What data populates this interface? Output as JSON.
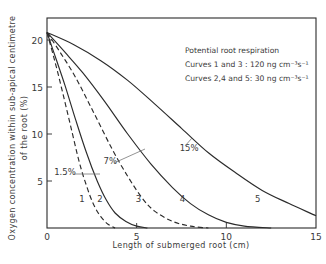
{
  "chart_data": {
    "type": "line",
    "title": "",
    "xlabel": "Length of submerged root (cm)",
    "ylabel_line1": "Oxygen concentration within sub-apical centimetre",
    "ylabel_line2": "of the root (%)",
    "xlim": [
      0,
      15
    ],
    "ylim": [
      0,
      22
    ],
    "x_ticks": [
      0,
      5,
      10,
      15
    ],
    "y_ticks": [
      5,
      10,
      15,
      20
    ],
    "grid": false,
    "legend": {
      "position": "upper right",
      "lines": [
        "Potential root respiration",
        "Curves 1 and 3 : 120 ng cm⁻³s⁻¹",
        "Curves 2,4 and 5: 30 ng cm⁻³s⁻¹"
      ]
    },
    "series": [
      {
        "name": "1",
        "style": "dashed",
        "respiration": "120 ng cm-3 s-1",
        "label_pos": [
          1.95,
          2.8
        ],
        "x": [
          0,
          0.4,
          0.8,
          1.3,
          1.8,
          2.2,
          2.6,
          3.0,
          3.4,
          3.8
        ],
        "y": [
          20.8,
          18.0,
          15.0,
          11.0,
          7.0,
          4.5,
          2.5,
          1.2,
          0.4,
          0.0
        ]
      },
      {
        "name": "2",
        "style": "solid",
        "respiration": "30 ng cm-3 s-1",
        "label_pos": [
          2.95,
          2.8
        ],
        "x": [
          0,
          0.5,
          1.0,
          1.6,
          2.2,
          2.8,
          3.3,
          3.8,
          4.4,
          5.0,
          5.6
        ],
        "y": [
          20.8,
          18.0,
          15.2,
          11.5,
          8.0,
          5.0,
          3.0,
          1.6,
          0.7,
          0.2,
          0.0
        ]
      },
      {
        "name": "3",
        "style": "dashed",
        "respiration": "120 ng cm-3 s-1",
        "label_pos": [
          5.1,
          2.8
        ],
        "x": [
          0,
          0.8,
          1.6,
          2.6,
          3.6,
          4.5,
          5.3,
          6.0,
          7.0,
          8.0,
          9.0
        ],
        "y": [
          20.8,
          18.5,
          16.0,
          12.3,
          8.5,
          5.5,
          3.2,
          1.8,
          0.7,
          0.2,
          0.0
        ]
      },
      {
        "name": "4",
        "style": "solid",
        "respiration": "30 ng cm-3 s-1",
        "label_pos": [
          7.55,
          2.8
        ],
        "x": [
          0,
          1.0,
          2.0,
          3.2,
          4.5,
          5.8,
          7.0,
          8.0,
          9.0,
          10.0,
          11.0,
          12.5
        ],
        "y": [
          20.8,
          18.7,
          16.5,
          13.5,
          10.0,
          6.8,
          4.3,
          2.6,
          1.4,
          0.6,
          0.2,
          0.0
        ]
      },
      {
        "name": "5",
        "style": "solid",
        "respiration": "30 ng cm-3 s-1",
        "label_pos": [
          11.75,
          2.8
        ],
        "x": [
          0,
          1.5,
          3.0,
          4.5,
          6.0,
          7.5,
          9.0,
          10.5,
          12.0,
          13.5,
          15.0
        ],
        "y": [
          20.8,
          19.5,
          17.8,
          15.7,
          13.2,
          10.6,
          8.0,
          5.9,
          4.0,
          2.6,
          1.3
        ]
      }
    ],
    "annotations": [
      {
        "text": "1.5%",
        "x": 0.4,
        "y": 5.6,
        "points_to_curve": "2"
      },
      {
        "text": "7%",
        "x": 3.15,
        "y": 6.8,
        "points_to_curve": "4"
      },
      {
        "text": "15%",
        "x": 7.4,
        "y": 8.2,
        "points_to_curve": "5"
      }
    ]
  }
}
